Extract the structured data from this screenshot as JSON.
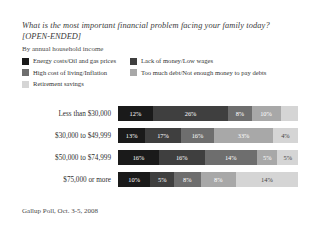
{
  "header": {
    "question": "What is the most important financial problem facing your family today?",
    "open_ended": "[OPEN-ENDED]",
    "byline": "By annual household income"
  },
  "footer": {
    "source": "Gallup Poll, Oct. 3-5, 2008"
  },
  "legend": [
    {
      "label": "Energy costs/Oil and gas prices",
      "color": "#1a1a1a"
    },
    {
      "label": "Lack of money/Low wages",
      "color": "#3f3f3f"
    },
    {
      "label": "High cost of living/Inflation",
      "color": "#6e6e6e"
    },
    {
      "label": "Too much debt/Not enough money to pay debts",
      "color": "#a8a8a8"
    },
    {
      "label": "Retirement savings",
      "color": "#d5d5d5"
    }
  ],
  "chart_data": {
    "type": "bar",
    "subtype": "stacked-horizontal",
    "title": "What is the most important financial problem facing your family today?",
    "subtitle": "By annual household income",
    "source": "Gallup Poll, Oct. 3-5, 2008",
    "xlabel": "",
    "ylabel": "",
    "xlim": [
      0,
      100
    ],
    "grid": false,
    "legend_position": "top",
    "categories": [
      "Less than $30,000",
      "$30,000 to $49,999",
      "$50,000 to $74,999",
      "$75,000 or more"
    ],
    "series": [
      {
        "name": "Energy costs/Oil and gas prices",
        "color": "#1a1a1a",
        "values": [
          12,
          13,
          16,
          10
        ]
      },
      {
        "name": "Lack of money/Low wages",
        "color": "#3f3f3f",
        "values": [
          26,
          17,
          16,
          5
        ]
      },
      {
        "name": "High cost of living/Inflation",
        "color": "#6e6e6e",
        "values": [
          8,
          16,
          14,
          8
        ]
      },
      {
        "name": "Too much debt/Not enough money to pay debts",
        "color": "#a8a8a8",
        "values": [
          10,
          33,
          5,
          8
        ]
      },
      {
        "name": "Retirement savings",
        "color": "#d5d5d5",
        "values": [
          0,
          4,
          5,
          14
        ]
      }
    ],
    "rows": [
      {
        "label": "Less than $30,000",
        "segments": [
          {
            "value": "12%",
            "pct": 12,
            "color": "#1a1a1a",
            "text_color": "#ffffff"
          },
          {
            "value": "26%",
            "pct": 26,
            "color": "#3f3f3f",
            "text_color": "#ffffff"
          },
          {
            "value": "8%",
            "pct": 8,
            "color": "#6e6e6e",
            "text_color": "#ffffff"
          },
          {
            "value": "10%",
            "pct": 10,
            "color": "#a8a8a8",
            "text_color": "#ffffff"
          },
          {
            "value": "",
            "pct": 6,
            "color": "#d5d5d5",
            "text_color": "#555555"
          }
        ]
      },
      {
        "label": "$30,000 to $49,999",
        "segments": [
          {
            "value": "13%",
            "pct": 13,
            "color": "#1a1a1a",
            "text_color": "#ffffff"
          },
          {
            "value": "17%",
            "pct": 17,
            "color": "#3f3f3f",
            "text_color": "#ffffff"
          },
          {
            "value": "16%",
            "pct": 16,
            "color": "#6e6e6e",
            "text_color": "#ffffff"
          },
          {
            "value": "33%",
            "pct": 28,
            "color": "#a8a8a8",
            "text_color": "#ffffff"
          },
          {
            "value": "4%",
            "pct": 12,
            "color": "#d5d5d5",
            "text_color": "#444444"
          }
        ]
      },
      {
        "label": "$50,000 to $74,999",
        "segments": [
          {
            "value": "16%",
            "pct": 18,
            "color": "#1a1a1a",
            "text_color": "#ffffff"
          },
          {
            "value": "16%",
            "pct": 20,
            "color": "#3f3f3f",
            "text_color": "#ffffff"
          },
          {
            "value": "14%",
            "pct": 23,
            "color": "#6e6e6e",
            "text_color": "#ffffff"
          },
          {
            "value": "5%",
            "pct": 9,
            "color": "#a8a8a8",
            "text_color": "#ffffff"
          },
          {
            "value": "5%",
            "pct": 9,
            "color": "#d5d5d5",
            "text_color": "#444444"
          }
        ]
      },
      {
        "label": "$75,000 or more",
        "segments": [
          {
            "value": "10%",
            "pct": 11,
            "color": "#1a1a1a",
            "text_color": "#ffffff"
          },
          {
            "value": "5%",
            "pct": 8,
            "color": "#3f3f3f",
            "text_color": "#ffffff"
          },
          {
            "value": "8%",
            "pct": 9,
            "color": "#6e6e6e",
            "text_color": "#ffffff"
          },
          {
            "value": "8%",
            "pct": 12,
            "color": "#a8a8a8",
            "text_color": "#ffffff"
          },
          {
            "value": "14%",
            "pct": 21,
            "color": "#d5d5d5",
            "text_color": "#444444"
          }
        ]
      }
    ]
  }
}
